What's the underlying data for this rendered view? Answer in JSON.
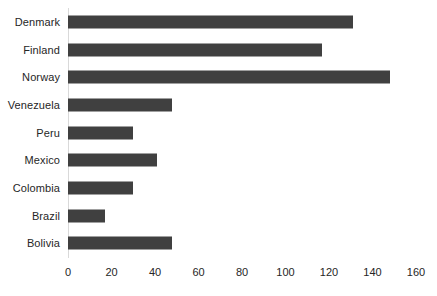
{
  "chart_data": {
    "type": "bar",
    "orientation": "horizontal",
    "title": "",
    "subtitle": "",
    "xlabel": "",
    "ylabel": "",
    "xlim": [
      0,
      160
    ],
    "xticks": [
      0,
      20,
      40,
      60,
      80,
      100,
      120,
      140,
      160
    ],
    "grid": false,
    "legend": false,
    "legend_position": "none",
    "bar_color": "#404040",
    "axis_line_color": "#d9d9d9",
    "text_color": "#262626",
    "background_color": "#ffffff",
    "categories": [
      "Denmark",
      "Finland",
      "Norway",
      "Venezuela",
      "Peru",
      "Mexico",
      "Colombia",
      "Brazil",
      "Bolivia"
    ],
    "values": [
      131,
      117,
      148,
      48,
      30,
      41,
      30,
      17,
      48
    ],
    "series": [
      {
        "name": "",
        "values": [
          131,
          117,
          148,
          48,
          30,
          41,
          30,
          17,
          48
        ]
      }
    ]
  }
}
